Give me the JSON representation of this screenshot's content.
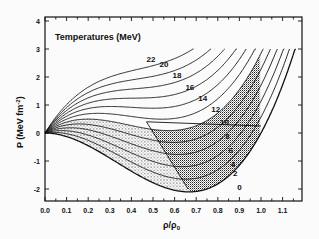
{
  "chart_data": {
    "type": "line",
    "title": "",
    "annotation": "Temperatures (MeV)",
    "xlabel": "ρ/ρ0",
    "ylabel": "P (MeV fm^-2)",
    "xlim": [
      0.0,
      1.18
    ],
    "ylim": [
      -2.43,
      4.15
    ],
    "x_ticks": [
      "0.0",
      "0.1",
      "0.2",
      "0.3",
      "0.4",
      "0.5",
      "0.6",
      "0.7",
      "0.8",
      "0.9",
      "1.0",
      "1.1"
    ],
    "y_ticks": [
      "-2",
      "-1",
      "0",
      "1",
      "2",
      "3",
      "4"
    ],
    "grid": false,
    "legend": "inline labels on curves",
    "model": {
      "A": -14.2,
      "B": 14.2,
      "k": 0.57,
      "formula": "P = A*r^2 + B*r^3 + k*T*r/(1+r)",
      "p_max": 3.0
    },
    "series": [
      {
        "name": "22",
        "T": 22,
        "label_at": [
          0.47,
          2.55
        ]
      },
      {
        "name": "20",
        "T": 20,
        "label_at": [
          0.53,
          2.35
        ]
      },
      {
        "name": "18",
        "T": 18,
        "label_at": [
          0.59,
          1.95
        ]
      },
      {
        "name": "16",
        "T": 16,
        "label_at": [
          0.65,
          1.55
        ]
      },
      {
        "name": "14",
        "T": 14,
        "label_at": [
          0.71,
          1.15
        ]
      },
      {
        "name": "12",
        "T": 12,
        "label_at": [
          0.77,
          0.75
        ]
      },
      {
        "name": "10",
        "T": 10,
        "label_at": [
          0.81,
          0.3
        ]
      },
      {
        "name": "8",
        "T": 8,
        "label_at": [
          0.835,
          -0.22
        ]
      },
      {
        "name": "6",
        "T": 6,
        "label_at": [
          0.85,
          -0.72
        ]
      },
      {
        "name": "4",
        "T": 4,
        "label_at": [
          0.86,
          -1.2
        ]
      },
      {
        "name": "2",
        "T": 2,
        "label_at": [
          0.87,
          -1.55
        ]
      },
      {
        "name": "0",
        "T": 0,
        "label_at": [
          0.89,
          -2.05
        ]
      }
    ],
    "sample_points": {
      "T0": [
        [
          0.0,
          0.0
        ],
        [
          0.2,
          -0.45
        ],
        [
          0.4,
          -1.36
        ],
        [
          0.5,
          -1.78
        ],
        [
          0.667,
          -2.1
        ],
        [
          0.8,
          -1.82
        ],
        [
          0.9,
          -1.15
        ],
        [
          1.0,
          0.0
        ],
        [
          1.15,
          2.8
        ]
      ],
      "T12": [
        [
          0.0,
          0.0
        ],
        [
          0.2,
          0.69
        ],
        [
          0.4,
          0.59
        ],
        [
          0.6,
          0.1
        ],
        [
          0.8,
          0.9
        ],
        [
          0.99,
          3.0
        ]
      ],
      "T22": [
        [
          0.0,
          0.0
        ],
        [
          0.1,
          1.0
        ],
        [
          0.3,
          2.3
        ],
        [
          0.5,
          2.4
        ],
        [
          0.58,
          3.0
        ]
      ]
    },
    "regions": [
      {
        "name": "spinodal",
        "fill": "dense stipple",
        "boundary_x_at_top": 0.47,
        "boundary_x_at_bottom": 0.67
      },
      {
        "name": "coexistence",
        "fill": "light stipple",
        "right_edge": [
          1.0,
          0.25
        ]
      }
    ]
  },
  "axes_text": {
    "annotation": "Temperatures (MeV)",
    "ylabel_main": "P (MeV fm",
    "ylabel_sup": "-2",
    "ylabel_end": ")",
    "xlabel_main": "ρ/ρ",
    "xlabel_sub": "0"
  }
}
